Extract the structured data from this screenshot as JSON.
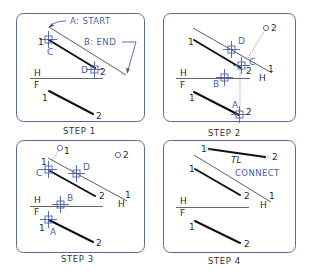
{
  "colors": {
    "panel_border": "#5a6a9a",
    "accent_blue": "#4a5fa8",
    "line": "#111111",
    "text": "#2a2a2a"
  },
  "panels": [
    {
      "caption": "STEP 1",
      "annotations": {
        "start": "A:  START",
        "end": "B:  END"
      },
      "labels": {
        "p1": "1",
        "p2": "2",
        "c": "C",
        "d": "D",
        "h": "H",
        "f": "F",
        "f1": "1",
        "f2": "2"
      }
    },
    {
      "caption": "STEP 2",
      "labels": {
        "o2": "2",
        "d": "D",
        "c": "C",
        "h1": "1",
        "hH": "H",
        "p1": "1",
        "p2": "2",
        "h": "H",
        "f": "F",
        "b": "B",
        "a": "A",
        "f1": "1",
        "f2": "2"
      }
    },
    {
      "caption": "STEP 3",
      "labels": {
        "o1": "1",
        "o2": "2",
        "p1": "1",
        "c": "C",
        "d": "D",
        "p2": "2",
        "h1": "1",
        "hH": "H",
        "h": "H",
        "f": "F",
        "b": "B",
        "f1": "1",
        "a": "A",
        "f2": "2"
      }
    },
    {
      "caption": "STEP 4",
      "annotations": {
        "tl": "TL",
        "connect": "CONNECT"
      },
      "labels": {
        "t1": "1",
        "t2": "2",
        "p1": "1",
        "p2": "2",
        "h1": "1",
        "hH": "H",
        "h": "H",
        "f": "F",
        "f1": "1",
        "f2": "2"
      }
    }
  ]
}
